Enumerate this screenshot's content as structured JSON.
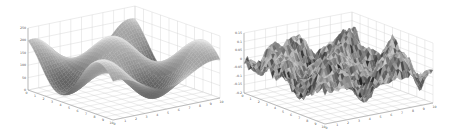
{
  "chart_data": [
    {
      "type": "surface",
      "title": "",
      "xlabel": "",
      "ylabel": "",
      "zlabel": "",
      "x_ticks": [
        "0",
        "1",
        "2",
        "3",
        "4",
        "5",
        "6",
        "7",
        "8",
        "9",
        "10"
      ],
      "y_ticks": [
        "0",
        "1",
        "2",
        "3",
        "4",
        "5",
        "6",
        "7",
        "8",
        "9",
        "10"
      ],
      "z_ticks": [
        "0",
        "50",
        "100",
        "150",
        "200",
        "250"
      ],
      "xlim": [
        0,
        10
      ],
      "ylim": [
        0,
        10
      ],
      "zlim": [
        0,
        250
      ],
      "grid": true,
      "colormap": "grayscale",
      "description": "Smooth periodic sinusoidal surface (egg-crate like), about two peaks and troughs along each axis",
      "function_hint": "z = A*sin(x)*cos(y) + offset",
      "color": "#7a7a7a"
    },
    {
      "type": "surface",
      "title": "",
      "xlabel": "",
      "ylabel": "",
      "zlabel": "",
      "x_ticks": [
        "0",
        "1",
        "2",
        "3",
        "4",
        "5",
        "6",
        "7",
        "8",
        "9",
        "10"
      ],
      "y_ticks": [
        "0",
        "1",
        "2",
        "3",
        "4",
        "5",
        "6",
        "7",
        "8",
        "9",
        "10"
      ],
      "z_ticks": [
        "-0.2",
        "-0.15",
        "-0.1",
        "-0.05",
        "0",
        "0.05",
        "0.1",
        "0.15"
      ],
      "xlim": [
        0,
        10
      ],
      "ylim": [
        0,
        10
      ],
      "zlim": [
        -0.2,
        0.15
      ],
      "grid": true,
      "colormap": "grayscale",
      "description": "Noisy multi-peak surface with a grid of rugged peaks and sharp troughs",
      "function_hint": "z = sin(x)*sin(y)*0.1 + noise",
      "color": "#6a6a6a"
    }
  ],
  "figure": {
    "panels": [
      "left-surface-plot",
      "right-surface-plot"
    ]
  }
}
